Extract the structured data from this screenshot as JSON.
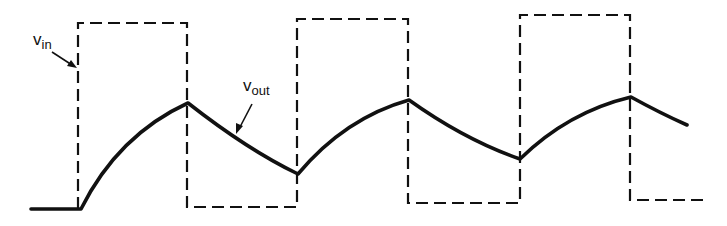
{
  "diagram": {
    "type": "waveform",
    "colors": {
      "stroke": "#111111",
      "background": "#ffffff"
    },
    "labels": {
      "vin": {
        "main": "v",
        "sub": "in"
      },
      "vout": {
        "main": "v",
        "sub": "out"
      }
    },
    "signals": [
      {
        "name": "v_in",
        "style": "dashed",
        "shape": "square-wave",
        "points": [
          [
            78,
            209
          ],
          [
            78,
            23
          ],
          [
            187,
            23
          ],
          [
            187,
            207
          ],
          [
            297,
            207
          ],
          [
            297,
            19
          ],
          [
            408,
            19
          ],
          [
            408,
            203
          ],
          [
            520,
            203
          ],
          [
            520,
            15
          ],
          [
            630,
            15
          ],
          [
            630,
            200
          ],
          [
            705,
            200
          ]
        ]
      },
      {
        "name": "v_out",
        "style": "solid-thick",
        "shape": "exponential-charge-discharge",
        "points": [
          [
            31,
            209
          ],
          [
            81,
            209
          ],
          [
            188,
            103
          ],
          [
            298,
            174
          ],
          [
            409,
            100
          ],
          [
            520,
            159
          ],
          [
            631,
            97
          ],
          [
            687,
            125
          ]
        ]
      }
    ]
  }
}
